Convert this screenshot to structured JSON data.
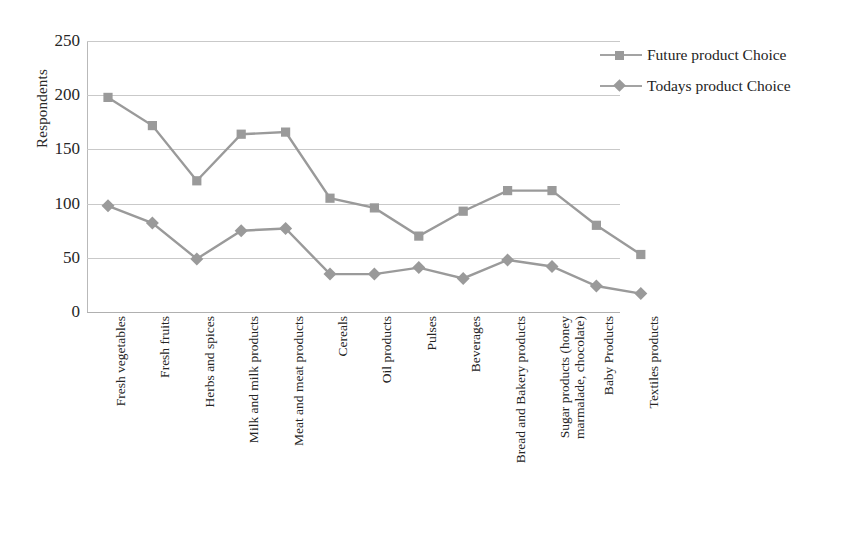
{
  "chart_data": {
    "type": "line",
    "title": "",
    "subtitle": "",
    "xlabel": "",
    "ylabel": "Respondents",
    "ylim": [
      0,
      250
    ],
    "ytick_step": 50,
    "yticks": [
      "250",
      "200",
      "150",
      "100",
      "50",
      "0"
    ],
    "grid": true,
    "legend_position": "top-right",
    "categories": [
      "Fresh vegetables",
      "Fresh fruits",
      "Herbs and spices",
      "Milk and milk products",
      "Meat and meat products",
      "Cereals",
      "Oil products",
      "Pulses",
      "Beverages",
      "Bread and Bakery products",
      "Sugar products (honey marmalade, chocolate)",
      "Baby Products",
      "Textiles products"
    ],
    "category_lines": [
      [
        "Fresh vegetables",
        ""
      ],
      [
        "Fresh fruits",
        ""
      ],
      [
        "Herbs and spices",
        ""
      ],
      [
        "Milk and milk products",
        ""
      ],
      [
        "Meat and meat products",
        ""
      ],
      [
        "Cereals",
        ""
      ],
      [
        "Oil products",
        ""
      ],
      [
        "Pulses",
        ""
      ],
      [
        "Beverages",
        ""
      ],
      [
        "Bread and Bakery products",
        ""
      ],
      [
        "Sugar products (honey",
        "marmalade, chocolate)"
      ],
      [
        "Baby Products",
        ""
      ],
      [
        "Textiles products",
        ""
      ]
    ],
    "series": [
      {
        "name": "Future product Choice",
        "marker": "square",
        "color": "#9a9a9a",
        "values": [
          198,
          172,
          121,
          164,
          166,
          105,
          96,
          70,
          93,
          112,
          112,
          80,
          53
        ]
      },
      {
        "name": "Todays product Choice",
        "marker": "diamond",
        "color": "#9a9a9a",
        "values": [
          98,
          82,
          49,
          75,
          77,
          35,
          35,
          41,
          31,
          48,
          42,
          24,
          17
        ]
      }
    ]
  },
  "legend": {
    "items": [
      {
        "label": "Future product Choice",
        "marker": "square"
      },
      {
        "label": "Todays product Choice",
        "marker": "diamond"
      }
    ]
  },
  "colors": {
    "series_gray": "#9a9a9a",
    "gridline": "#c9c9c9",
    "axis": "#b0b0b0",
    "text": "#242424",
    "background": "#ffffff"
  }
}
